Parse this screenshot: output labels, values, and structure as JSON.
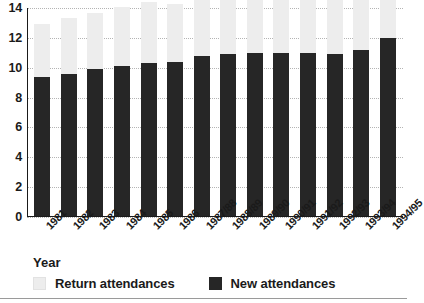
{
  "chart_data": {
    "type": "bar",
    "subtype": "stacked-vertical",
    "title": "",
    "xlabel": "Year",
    "ylabel": "",
    "ylim": [
      0,
      14
    ],
    "yticks": [
      0,
      2,
      4,
      6,
      8,
      10,
      12,
      14
    ],
    "grid": true,
    "legend_position": "bottom-left",
    "categories": [
      "1981",
      "1982",
      "1983",
      "1984",
      "1985",
      "1986",
      "1987/88",
      "1988/89",
      "1989/90",
      "1990/91",
      "1991/92",
      "1992/93",
      "1993/94",
      "1994/95"
    ],
    "series": [
      {
        "name": "New attendances",
        "color": "#262626",
        "values": [
          9.4,
          9.6,
          9.9,
          10.1,
          10.3,
          10.4,
          10.8,
          10.9,
          11.0,
          11.0,
          11.0,
          10.9,
          11.2,
          12.0
        ]
      },
      {
        "name": "Return attendances",
        "color": "#ededed",
        "values": [
          3.5,
          3.7,
          3.8,
          4.0,
          4.1,
          3.9,
          4.1,
          4.1,
          4.1,
          4.0,
          3.9,
          4.0,
          3.9,
          4.0
        ]
      }
    ],
    "stack_totals": [
      12.9,
      13.3,
      13.7,
      14.1,
      14.4,
      14.3,
      14.9,
      15.0,
      15.1,
      15.0,
      14.9,
      14.9,
      15.1,
      16.0
    ]
  },
  "axis": {
    "ylabels": [
      "14",
      "12",
      "10",
      "8",
      "6",
      "4",
      "2",
      "0"
    ],
    "xtitle": "Year"
  },
  "legend": {
    "items": [
      {
        "label": "Return attendances",
        "color": "#ededed"
      },
      {
        "label": "New attendances",
        "color": "#262626"
      }
    ]
  }
}
